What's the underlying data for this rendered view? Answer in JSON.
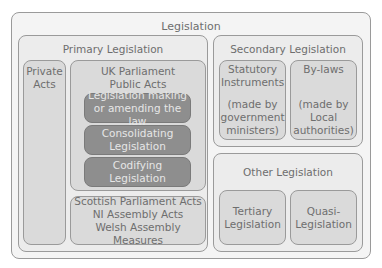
{
  "title": "Legislation",
  "primary": {
    "title": "Primary Legislation",
    "private_acts": [
      "Private",
      "Acts"
    ],
    "uk_parliament": {
      "title": [
        "UK Parliament",
        "Public Acts"
      ],
      "items": [
        [
          "Legislation making",
          "or amending the law"
        ],
        [
          "Consolidating",
          "Legislation"
        ],
        [
          "Codifying",
          "Legislation"
        ]
      ]
    },
    "devolved": [
      "Scottish Parliament Acts",
      "NI Assembly Acts",
      "Welsh Assembly Measures"
    ]
  },
  "secondary": {
    "title": "Secondary Legislation",
    "statutory": {
      "title": [
        "Statutory",
        "Instruments"
      ],
      "note": [
        "(made by",
        "government",
        "ministers)"
      ]
    },
    "bylaws": {
      "title": [
        "By-laws"
      ],
      "note": [
        "(made by",
        "Local",
        "authorities)"
      ]
    }
  },
  "other": {
    "title": "Other Legislation",
    "items": [
      [
        "Tertiary",
        "Legislation"
      ],
      [
        "Quasi-",
        "Legislation"
      ]
    ]
  },
  "colors": {
    "dark_box": "#8e8e8e",
    "light_box": "#dadada",
    "border": "#9a9a9a",
    "text": "#6e6e6e"
  }
}
